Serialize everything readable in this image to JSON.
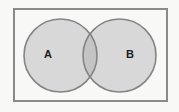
{
  "figure": {
    "name": "venn-diagram-two-sets",
    "width": 179,
    "height": 112,
    "background_color": "#f8f8f7"
  },
  "universe": {
    "label": "",
    "shape": "rectangle",
    "x": 13,
    "y": 8,
    "width": 155,
    "height": 94,
    "stroke_color": "#8a8a8a",
    "stroke_width": 2,
    "fill_color": "#f8f8f7"
  },
  "sets": [
    {
      "label": "A",
      "shape": "circle",
      "cx": 60.5,
      "cy": 55.5,
      "r": 36.5,
      "fill_color": "#d8d8d8",
      "stroke_color": "#848484",
      "stroke_width": 1.6,
      "label_x": 48,
      "label_y": 55
    },
    {
      "label": "B",
      "shape": "circle",
      "cx": 119.5,
      "cy": 55.5,
      "r": 36.5,
      "fill_color": "#d8d8d8",
      "stroke_color": "#848484",
      "stroke_width": 1.6,
      "label_x": 130,
      "label_y": 55
    }
  ],
  "intersection": {
    "label": "",
    "fill_color": "#c4c4c4",
    "description": "A intersect B"
  },
  "colors": {
    "set_fill": "#d8d8d8",
    "intersection_fill": "#c4c4c4",
    "outline": "#848484",
    "universe_border": "#8a8a8a",
    "background": "#f8f8f7",
    "label_text": "#1b1b1b"
  }
}
